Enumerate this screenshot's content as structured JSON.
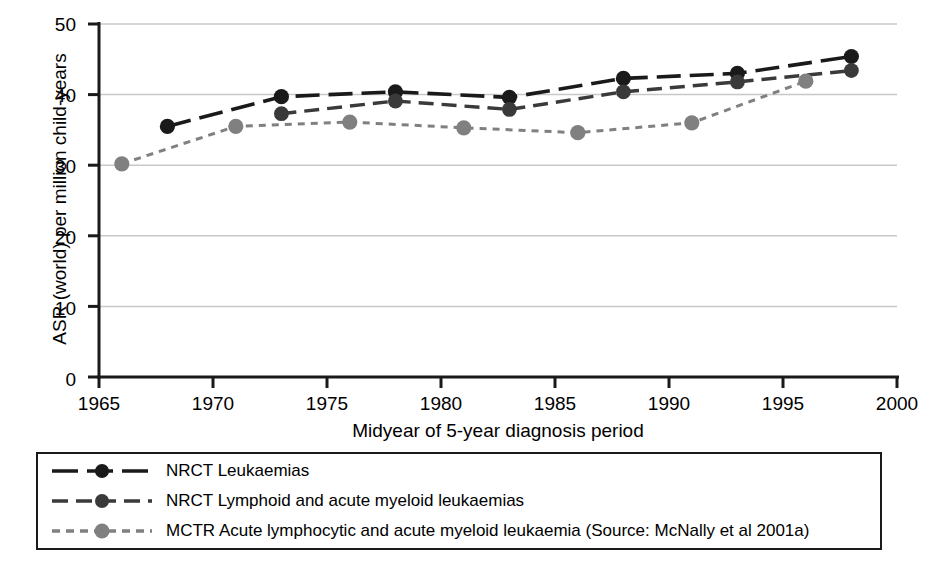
{
  "chart_data": {
    "type": "line",
    "title": "",
    "xlabel": "Midyear of 5-year diagnosis period",
    "ylabel": "ASR (world) per million child-years",
    "xlim": [
      1965,
      2000
    ],
    "ylim": [
      0,
      50
    ],
    "xticks": [
      1965,
      1970,
      1975,
      1980,
      1985,
      1990,
      1995,
      2000
    ],
    "yticks": [
      0,
      10,
      20,
      30,
      40,
      50
    ],
    "grid": "horizontal",
    "legend_position": "below-plot",
    "series": [
      {
        "name": "NRCT Leukaemias",
        "color": "#1a1a1a",
        "line_style": "long-dash",
        "marker": "circle",
        "x": [
          1968,
          1973,
          1978,
          1983,
          1988,
          1993,
          1998
        ],
        "values": [
          35.5,
          39.7,
          40.4,
          39.6,
          42.3,
          43.0,
          45.4
        ]
      },
      {
        "name": "NRCT Lymphoid and acute myeloid leukaemias",
        "color": "#3a3a3a",
        "line_style": "dash",
        "marker": "circle",
        "x": [
          1973,
          1978,
          1983,
          1988,
          1993,
          1998
        ],
        "values": [
          37.3,
          39.1,
          37.9,
          40.4,
          41.8,
          43.4
        ]
      },
      {
        "name": "MCTR Acute lymphocytic and acute myeloid leukaemia (Source: McNally et al 2001a)",
        "color": "#808080",
        "line_style": "short-dash",
        "marker": "circle",
        "x": [
          1966,
          1971,
          1976,
          1981,
          1986,
          1991,
          1996
        ],
        "values": [
          30.2,
          35.5,
          36.1,
          35.3,
          34.6,
          36.0,
          41.9
        ]
      }
    ]
  },
  "axis": {
    "y_title": "ASR (world) per million child-years",
    "x_title": "Midyear of 5-year diagnosis period",
    "y_tick_labels": [
      "50",
      "40",
      "30",
      "20",
      "10",
      "0"
    ],
    "x_tick_labels": [
      "1965",
      "1970",
      "1975",
      "1980",
      "1985",
      "1990",
      "1995",
      "2000"
    ]
  },
  "legend": {
    "entries": [
      {
        "label": "NRCT Leukaemias"
      },
      {
        "label": "NRCT Lymphoid and acute myeloid leukaemias"
      },
      {
        "label": "MCTR Acute lymphocytic and acute myeloid leukaemia (Source: McNally et al 2001a)"
      }
    ]
  },
  "colors": {
    "series1": "#1a1a1a",
    "series2": "#3a3a3a",
    "series3": "#808080",
    "grid": "#c8c8c8",
    "axis": "#1a1a1a",
    "background": "#ffffff"
  }
}
